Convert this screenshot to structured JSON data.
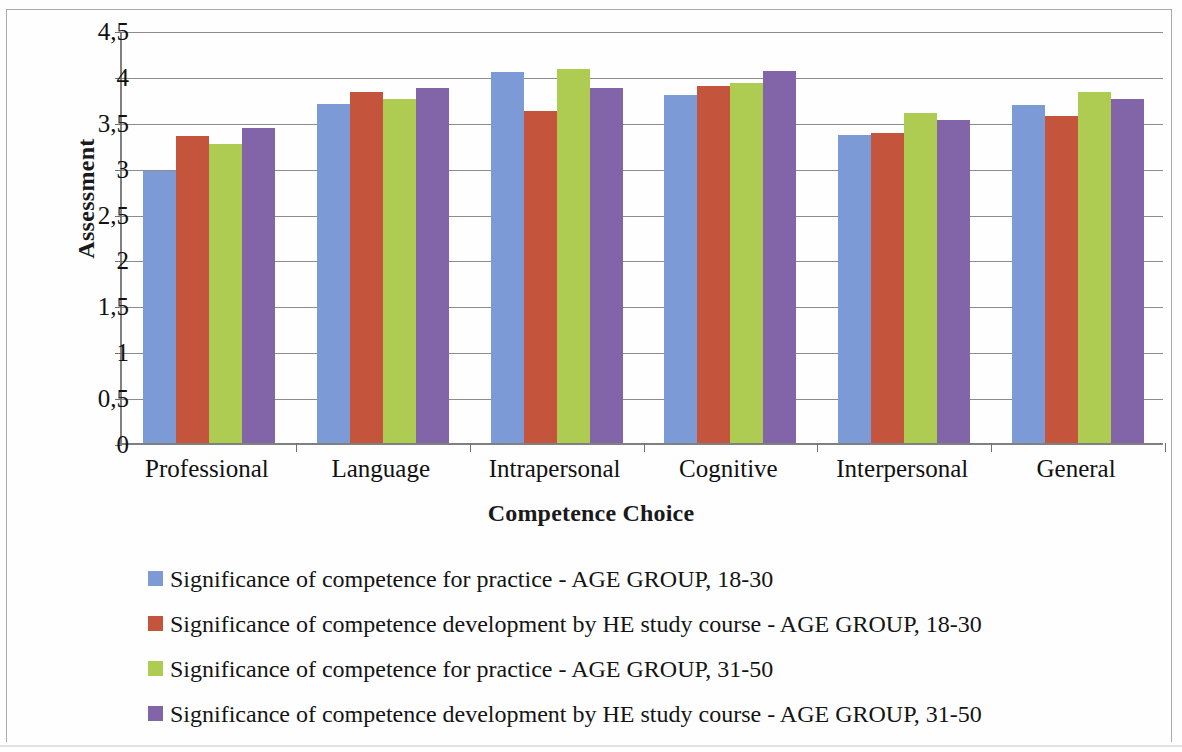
{
  "chart_data": {
    "type": "bar",
    "title": "",
    "xlabel": "Competence Choice",
    "ylabel": "Assessment",
    "ylim": [
      0,
      4.5
    ],
    "ytick_labels": [
      "0",
      "0,5",
      "1",
      "1,5",
      "2",
      "2,5",
      "3",
      "3,5",
      "4",
      "4,5"
    ],
    "ytick_values": [
      0,
      0.5,
      1,
      1.5,
      2,
      2.5,
      3,
      3.5,
      4,
      4.5
    ],
    "grid": true,
    "legend_position": "bottom",
    "categories": [
      "Professional",
      "Language",
      "Intrapersonal",
      "Cognitive",
      "Interpersonal",
      "General"
    ],
    "series": [
      {
        "name": "Significance of competence for practice - AGE GROUP, 18-30",
        "color": "#7B9AD6",
        "values": [
          2.96,
          3.69,
          4.04,
          3.79,
          3.36,
          3.68
        ]
      },
      {
        "name": "Significance of competence development by HE study course - AGE GROUP, 18-30",
        "color": "#C4553C",
        "values": [
          3.34,
          3.83,
          3.62,
          3.89,
          3.38,
          3.56
        ]
      },
      {
        "name": "Significance of competence for practice - AGE GROUP, 31-50",
        "color": "#AFCC52",
        "values": [
          3.26,
          3.75,
          4.08,
          3.92,
          3.6,
          3.83
        ]
      },
      {
        "name": "Significance of competence development by HE study course - AGE GROUP, 31-50",
        "color": "#8264A8",
        "values": [
          3.43,
          3.87,
          3.87,
          4.05,
          3.52,
          3.75
        ]
      }
    ]
  }
}
